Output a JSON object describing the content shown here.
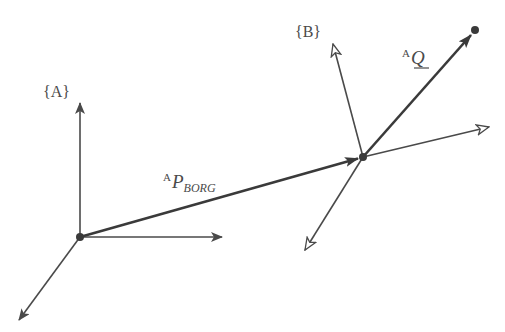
{
  "diagram": {
    "frames": [
      {
        "name": "A",
        "label": "{A}",
        "origin": [
          80,
          237
        ],
        "axes": {
          "x_tip": [
            222,
            237
          ],
          "y_tip": [
            80,
            103
          ],
          "z_tip": [
            19,
            320
          ]
        },
        "arrow_style": "filled"
      },
      {
        "name": "B",
        "label": "{B}",
        "origin": [
          363,
          157
        ],
        "axes": {
          "x_tip": [
            489,
            127
          ],
          "y_tip": [
            333,
            44
          ],
          "z_tip": [
            305,
            250
          ]
        },
        "arrow_style": "hollow"
      }
    ],
    "vectors": [
      {
        "name": "P_BORG",
        "label_sup": "A",
        "label_main": "P",
        "label_sub": "BORG",
        "from": [
          80,
          237
        ],
        "to": [
          363,
          157
        ]
      },
      {
        "name": "Q",
        "label_sup": "A",
        "label_main": "Q",
        "from": [
          363,
          157
        ],
        "to": [
          475,
          30
        ]
      }
    ],
    "points": [
      {
        "name": "Q",
        "position": [
          475,
          30
        ]
      }
    ],
    "colors": {
      "line": "#4a4a4a",
      "vector": "#3a3a3a",
      "background": "#ffffff"
    }
  }
}
